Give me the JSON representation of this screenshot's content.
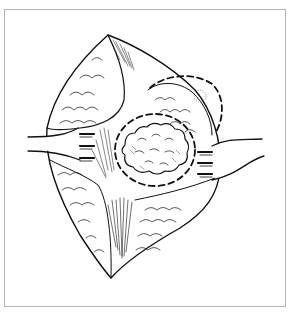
{
  "figure": {
    "colors": {
      "background": "#ffffff",
      "ink": "#111111",
      "frame_border": "#b5b5b5"
    },
    "elements": {
      "left_retractor": "retractor-left",
      "right_retractor": "retractor-right",
      "mass": "lobulated-mass",
      "inner_dashed_outline": "dashed-resection-margin",
      "outer_dashed_outline": "dashed-secondary-margin"
    }
  }
}
